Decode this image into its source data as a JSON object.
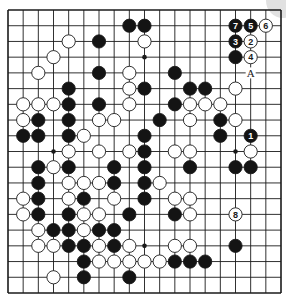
{
  "diagram": {
    "type": "go-board",
    "size": 19,
    "geometry": {
      "left": 8,
      "top": 10,
      "right": 281,
      "bottom": 293,
      "stone_radius": 6.6
    },
    "colors": {
      "line": "#1a1a1a",
      "black_stone": "#141414",
      "white_stone": "#ffffff",
      "stone_outline": "#1a1a1a",
      "background": "#ffffff",
      "number_on_black": "#ffffff",
      "number_on_white": "#1a1a1a"
    },
    "star_points": [
      [
        3,
        9
      ],
      [
        9,
        3
      ],
      [
        9,
        15
      ],
      [
        15,
        9
      ],
      [
        15,
        15
      ]
    ],
    "stones": [
      {
        "c": 8,
        "r": 1,
        "color": "black"
      },
      {
        "c": 9,
        "r": 1,
        "color": "black"
      },
      {
        "c": 15,
        "r": 1,
        "color": "black",
        "label": "7"
      },
      {
        "c": 16,
        "r": 1,
        "color": "black",
        "label": "5"
      },
      {
        "c": 17,
        "r": 1,
        "color": "white",
        "label": "6"
      },
      {
        "c": 4,
        "r": 2,
        "color": "white"
      },
      {
        "c": 6,
        "r": 2,
        "color": "black"
      },
      {
        "c": 9,
        "r": 2,
        "color": "white"
      },
      {
        "c": 15,
        "r": 2,
        "color": "black",
        "label": "3"
      },
      {
        "c": 16,
        "r": 2,
        "color": "white",
        "label": "2"
      },
      {
        "c": 3,
        "r": 3,
        "color": "white"
      },
      {
        "c": 15,
        "r": 3,
        "color": "black"
      },
      {
        "c": 16,
        "r": 3,
        "color": "white",
        "label": "4"
      },
      {
        "c": 2,
        "r": 4,
        "color": "white"
      },
      {
        "c": 6,
        "r": 4,
        "color": "black"
      },
      {
        "c": 8,
        "r": 4,
        "color": "white"
      },
      {
        "c": 11,
        "r": 4,
        "color": "black"
      },
      {
        "c": 4,
        "r": 5,
        "color": "black"
      },
      {
        "c": 8,
        "r": 5,
        "color": "white"
      },
      {
        "c": 9,
        "r": 5,
        "color": "black"
      },
      {
        "c": 12,
        "r": 5,
        "color": "black"
      },
      {
        "c": 13,
        "r": 5,
        "color": "black"
      },
      {
        "c": 15,
        "r": 5,
        "color": "white"
      },
      {
        "c": 1,
        "r": 6,
        "color": "white"
      },
      {
        "c": 2,
        "r": 6,
        "color": "white"
      },
      {
        "c": 3,
        "r": 6,
        "color": "white"
      },
      {
        "c": 4,
        "r": 6,
        "color": "black"
      },
      {
        "c": 6,
        "r": 6,
        "color": "black"
      },
      {
        "c": 8,
        "r": 6,
        "color": "white"
      },
      {
        "c": 11,
        "r": 6,
        "color": "black"
      },
      {
        "c": 12,
        "r": 6,
        "color": "white"
      },
      {
        "c": 13,
        "r": 6,
        "color": "white"
      },
      {
        "c": 14,
        "r": 6,
        "color": "white"
      },
      {
        "c": 1,
        "r": 7,
        "color": "white"
      },
      {
        "c": 2,
        "r": 7,
        "color": "black"
      },
      {
        "c": 4,
        "r": 7,
        "color": "black"
      },
      {
        "c": 6,
        "r": 7,
        "color": "white"
      },
      {
        "c": 7,
        "r": 7,
        "color": "white"
      },
      {
        "c": 10,
        "r": 7,
        "color": "black"
      },
      {
        "c": 12,
        "r": 7,
        "color": "white"
      },
      {
        "c": 14,
        "r": 7,
        "color": "black"
      },
      {
        "c": 15,
        "r": 7,
        "color": "white"
      },
      {
        "c": 1,
        "r": 8,
        "color": "black"
      },
      {
        "c": 2,
        "r": 8,
        "color": "black"
      },
      {
        "c": 4,
        "r": 8,
        "color": "black"
      },
      {
        "c": 5,
        "r": 8,
        "color": "white"
      },
      {
        "c": 9,
        "r": 8,
        "color": "black"
      },
      {
        "c": 14,
        "r": 8,
        "color": "black"
      },
      {
        "c": 16,
        "r": 8,
        "color": "black",
        "label": "1"
      },
      {
        "c": 4,
        "r": 9,
        "color": "white"
      },
      {
        "c": 6,
        "r": 9,
        "color": "white"
      },
      {
        "c": 8,
        "r": 9,
        "color": "white"
      },
      {
        "c": 9,
        "r": 9,
        "color": "black"
      },
      {
        "c": 11,
        "r": 9,
        "color": "white"
      },
      {
        "c": 12,
        "r": 9,
        "color": "white"
      },
      {
        "c": 16,
        "r": 9,
        "color": "white"
      },
      {
        "c": 2,
        "r": 10,
        "color": "black"
      },
      {
        "c": 3,
        "r": 10,
        "color": "white"
      },
      {
        "c": 4,
        "r": 10,
        "color": "black"
      },
      {
        "c": 7,
        "r": 10,
        "color": "black"
      },
      {
        "c": 9,
        "r": 10,
        "color": "black"
      },
      {
        "c": 12,
        "r": 10,
        "color": "black"
      },
      {
        "c": 15,
        "r": 10,
        "color": "black"
      },
      {
        "c": 16,
        "r": 10,
        "color": "black"
      },
      {
        "c": 2,
        "r": 11,
        "color": "black"
      },
      {
        "c": 4,
        "r": 11,
        "color": "white"
      },
      {
        "c": 5,
        "r": 11,
        "color": "white"
      },
      {
        "c": 6,
        "r": 11,
        "color": "white"
      },
      {
        "c": 7,
        "r": 11,
        "color": "black"
      },
      {
        "c": 9,
        "r": 11,
        "color": "black"
      },
      {
        "c": 10,
        "r": 11,
        "color": "white"
      },
      {
        "c": 1,
        "r": 12,
        "color": "white"
      },
      {
        "c": 2,
        "r": 12,
        "color": "black"
      },
      {
        "c": 4,
        "r": 12,
        "color": "white"
      },
      {
        "c": 5,
        "r": 12,
        "color": "black"
      },
      {
        "c": 7,
        "r": 12,
        "color": "white"
      },
      {
        "c": 9,
        "r": 12,
        "color": "black"
      },
      {
        "c": 11,
        "r": 12,
        "color": "white"
      },
      {
        "c": 12,
        "r": 12,
        "color": "white"
      },
      {
        "c": 1,
        "r": 13,
        "color": "white"
      },
      {
        "c": 2,
        "r": 13,
        "color": "black"
      },
      {
        "c": 4,
        "r": 13,
        "color": "black"
      },
      {
        "c": 5,
        "r": 13,
        "color": "white"
      },
      {
        "c": 6,
        "r": 13,
        "color": "white"
      },
      {
        "c": 8,
        "r": 13,
        "color": "black"
      },
      {
        "c": 11,
        "r": 13,
        "color": "black"
      },
      {
        "c": 12,
        "r": 13,
        "color": "white"
      },
      {
        "c": 15,
        "r": 13,
        "color": "white",
        "label": "8"
      },
      {
        "c": 2,
        "r": 14,
        "color": "white"
      },
      {
        "c": 3,
        "r": 14,
        "color": "black"
      },
      {
        "c": 4,
        "r": 14,
        "color": "black"
      },
      {
        "c": 5,
        "r": 14,
        "color": "white"
      },
      {
        "c": 6,
        "r": 14,
        "color": "black"
      },
      {
        "c": 7,
        "r": 14,
        "color": "black"
      },
      {
        "c": 2,
        "r": 15,
        "color": "white"
      },
      {
        "c": 3,
        "r": 15,
        "color": "white"
      },
      {
        "c": 4,
        "r": 15,
        "color": "black"
      },
      {
        "c": 5,
        "r": 15,
        "color": "black"
      },
      {
        "c": 6,
        "r": 15,
        "color": "white"
      },
      {
        "c": 7,
        "r": 15,
        "color": "black"
      },
      {
        "c": 8,
        "r": 15,
        "color": "white"
      },
      {
        "c": 11,
        "r": 15,
        "color": "white"
      },
      {
        "c": 12,
        "r": 15,
        "color": "white"
      },
      {
        "c": 15,
        "r": 15,
        "color": "black"
      },
      {
        "c": 5,
        "r": 16,
        "color": "black"
      },
      {
        "c": 6,
        "r": 16,
        "color": "white"
      },
      {
        "c": 7,
        "r": 16,
        "color": "white"
      },
      {
        "c": 8,
        "r": 16,
        "color": "white"
      },
      {
        "c": 9,
        "r": 16,
        "color": "white"
      },
      {
        "c": 10,
        "r": 16,
        "color": "white"
      },
      {
        "c": 11,
        "r": 16,
        "color": "black"
      },
      {
        "c": 12,
        "r": 16,
        "color": "black"
      },
      {
        "c": 13,
        "r": 16,
        "color": "black"
      },
      {
        "c": 3,
        "r": 17,
        "color": "white"
      },
      {
        "c": 5,
        "r": 17,
        "color": "black"
      },
      {
        "c": 8,
        "r": 17,
        "color": "black"
      }
    ],
    "markers": [
      {
        "c": 16,
        "r": 4,
        "text": "A"
      }
    ]
  }
}
